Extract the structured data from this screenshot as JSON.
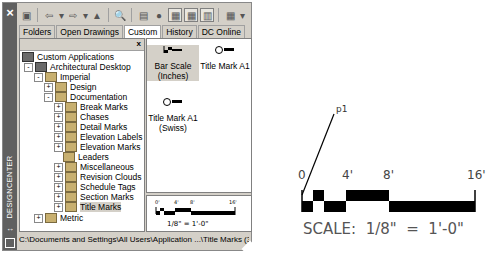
{
  "designcenter": {
    "title": "DESIGNCENTER",
    "toolbar": {
      "icons": [
        "load-icon",
        "back-icon",
        "back-dropdown-icon",
        "forward-icon",
        "forward-dropdown-icon",
        "up-icon",
        "search-icon",
        "favorites-icon",
        "home-icon",
        "tree-view-toggle-icon",
        "preview-toggle-icon",
        "description-toggle-icon",
        "views-icon",
        "views-dropdown-icon"
      ]
    },
    "tabs": [
      {
        "label": "Folders",
        "active": false
      },
      {
        "label": "Open Drawings",
        "active": false
      },
      {
        "label": "Custom",
        "active": true
      },
      {
        "label": "History",
        "active": false
      },
      {
        "label": "DC Online",
        "active": false
      }
    ],
    "tree": {
      "close_label": "x",
      "nodes": [
        {
          "label": "Custom Applications",
          "level": 0,
          "expander": "",
          "icon": "app"
        },
        {
          "label": "Architectural Desktop",
          "level": 1,
          "expander": "-",
          "icon": "app"
        },
        {
          "label": "Imperial",
          "level": 2,
          "expander": "-",
          "icon": "folder"
        },
        {
          "label": "Design",
          "level": 3,
          "expander": "+",
          "icon": "folder"
        },
        {
          "label": "Documentation",
          "level": 3,
          "expander": "-",
          "icon": "folder"
        },
        {
          "label": "Break Marks",
          "level": 4,
          "expander": "+",
          "icon": "folder"
        },
        {
          "label": "Chases",
          "level": 4,
          "expander": "+",
          "icon": "folder"
        },
        {
          "label": "Detail Marks",
          "level": 4,
          "expander": "+",
          "icon": "folder"
        },
        {
          "label": "Elevation Labels",
          "level": 4,
          "expander": "+",
          "icon": "folder"
        },
        {
          "label": "Elevation Marks",
          "level": 4,
          "expander": "+",
          "icon": "folder"
        },
        {
          "label": "Leaders",
          "level": 4,
          "expander": "",
          "icon": "folder"
        },
        {
          "label": "Miscellaneous",
          "level": 4,
          "expander": "+",
          "icon": "folder"
        },
        {
          "label": "Revision Clouds",
          "level": 4,
          "expander": "+",
          "icon": "folder"
        },
        {
          "label": "Schedule Tags",
          "level": 4,
          "expander": "+",
          "icon": "folder"
        },
        {
          "label": "Section Marks",
          "level": 4,
          "expander": "+",
          "icon": "folder"
        },
        {
          "label": "Title Marks",
          "level": 4,
          "expander": "+",
          "icon": "folder",
          "selected": true
        },
        {
          "label": "Metric",
          "level": 2,
          "expander": "+",
          "icon": "folder"
        }
      ]
    },
    "content_items": [
      {
        "label_line1": "Bar Scale",
        "label_line2": "(Inches)",
        "selected": true
      },
      {
        "label_line1": "Title Mark A1",
        "label_line2": "",
        "selected": false
      },
      {
        "label_line1": "Title Mark A1",
        "label_line2": "(Swiss)",
        "selected": false
      }
    ],
    "preview": {
      "ticks": [
        "0'",
        "4'",
        "8'",
        "16'"
      ],
      "scale_text": "1/8\" = 1'-0\""
    },
    "status_path": "C:\\Documents and Settings\\All Users\\Application ...\\Title Marks (3 Item(s))"
  },
  "drawing": {
    "point_label": "p1",
    "ticks": [
      "0",
      "4'",
      "8'",
      "16'"
    ],
    "scale_text": "SCALE:  1/8\"  =  1'-0\""
  }
}
